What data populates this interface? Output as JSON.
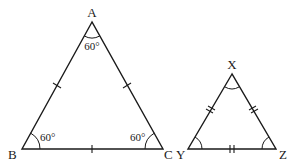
{
  "diagram": {
    "colors": {
      "stroke": "#1a1a1a",
      "background": "#ffffff"
    },
    "triangle_abc": {
      "vertices": {
        "A": {
          "label": "A",
          "x": 92,
          "y": 22
        },
        "B": {
          "label": "B",
          "x": 22,
          "y": 149
        },
        "C": {
          "label": "C",
          "x": 163,
          "y": 149
        }
      },
      "angles": {
        "A": "60°",
        "B": "60°",
        "C": "60°"
      },
      "side_marks": "single tick on each side (AB = BC = CA)"
    },
    "triangle_xyz": {
      "vertices": {
        "X": {
          "label": "X",
          "x": 232,
          "y": 74
        },
        "Y": {
          "label": "Y",
          "x": 188,
          "y": 149
        },
        "Z": {
          "label": "Z",
          "x": 276,
          "y": 149
        }
      },
      "angles": {
        "X": "",
        "Y": "",
        "Z": ""
      },
      "side_marks": "double tick on each side (XY = YZ = ZX)"
    }
  }
}
